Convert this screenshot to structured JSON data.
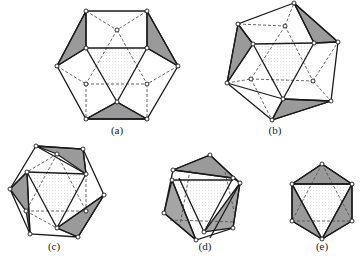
{
  "figure": {
    "colors": {
      "edge": "#1a1a1a",
      "hidden_edge": "#555555",
      "shade": "#9a9a9a",
      "vertex_fill": "#ffffff",
      "background": "#ffffff"
    },
    "panels": [
      {
        "id": "a",
        "label": "(a)",
        "label_pos": [
          117,
          131
        ]
      },
      {
        "id": "b",
        "label": "(b)",
        "label_pos": [
          275,
          131
        ]
      },
      {
        "id": "c",
        "label": "(c)",
        "label_pos": [
          54,
          247
        ]
      },
      {
        "id": "d",
        "label": "(d)",
        "label_pos": [
          205,
          247
        ]
      },
      {
        "id": "e",
        "label": "(e)",
        "label_pos": [
          322,
          247
        ]
      }
    ]
  }
}
